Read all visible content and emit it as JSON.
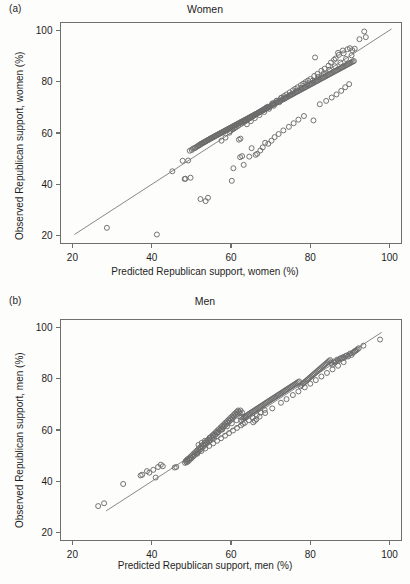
{
  "figure": {
    "background_color": "#fdfdfc",
    "point_stroke_color": "#6b6b6b",
    "line_color": "#7a7a7a",
    "axis_color": "#6f6f6f"
  },
  "panels": [
    {
      "tag": "(a)",
      "title": "Women",
      "xlabel": "Predicted Republican support, women (%)",
      "ylabel": "Observed Republican support, women (%)"
    },
    {
      "tag": "(b)",
      "title": "Men",
      "xlabel": "Predicted Republican support, men (%)",
      "ylabel": "Observed Republican support, men (%)"
    }
  ],
  "chart_data": [
    {
      "type": "scatter",
      "panel": "(a)",
      "title": "Women",
      "xlabel": "Predicted Republican support, women (%)",
      "ylabel": "Observed Republican support, women (%)",
      "xlim": [
        17,
        103
      ],
      "ylim": [
        17,
        103
      ],
      "xticks": [
        20,
        40,
        60,
        80,
        100
      ],
      "yticks": [
        20,
        40,
        60,
        80,
        100
      ],
      "grid": false,
      "legend": "none",
      "reference_line": {
        "label": "y = x identity line",
        "x_start": 20.5,
        "y_start": 20.5,
        "x_end": 100.5,
        "y_end": 100.5
      },
      "marker": {
        "shape": "open-circle",
        "radius_px": 2.5
      },
      "x": [
        28.7,
        41.3,
        45.2,
        47.8,
        48.3,
        49.2,
        49.6,
        50.1,
        50.4,
        50.8,
        51.0,
        51.3,
        51.6,
        51.9,
        52.0,
        52.2,
        52.4,
        52.6,
        52.8,
        53.0,
        53.2,
        53.4,
        53.6,
        53.8,
        54.0,
        54.2,
        54.4,
        54.6,
        54.8,
        55.0,
        55.2,
        55.4,
        55.6,
        55.8,
        56.0,
        56.2,
        56.4,
        56.6,
        56.8,
        57.0,
        57.2,
        57.4,
        57.6,
        57.8,
        58.0,
        58.2,
        58.4,
        58.6,
        58.8,
        59.0,
        59.2,
        59.4,
        59.6,
        59.8,
        60.0,
        60.2,
        60.4,
        60.6,
        60.8,
        61.0,
        61.2,
        61.4,
        61.6,
        61.8,
        62.0,
        62.2,
        62.4,
        62.6,
        62.8,
        63.0,
        63.2,
        63.4,
        63.6,
        63.8,
        64.0,
        64.2,
        64.4,
        64.6,
        64.8,
        65.0,
        65.2,
        65.4,
        65.6,
        65.8,
        66.0,
        66.2,
        66.4,
        66.6,
        66.8,
        67.0,
        67.2,
        67.4,
        67.6,
        67.8,
        68.0,
        68.2,
        68.4,
        68.6,
        68.8,
        69.0,
        69.2,
        69.4,
        69.6,
        69.8,
        70.0,
        70.3,
        70.6,
        70.9,
        71.2,
        71.5,
        71.8,
        72.1,
        72.4,
        72.7,
        73.0,
        73.3,
        73.6,
        73.9,
        74.2,
        74.5,
        74.8,
        75.1,
        75.4,
        75.7,
        76.0,
        76.3,
        76.6,
        76.9,
        77.2,
        77.5,
        77.8,
        78.1,
        78.4,
        78.7,
        79.0,
        79.3,
        79.6,
        79.9,
        80.2,
        80.5,
        80.8,
        81.1,
        81.4,
        81.7,
        82.0,
        82.3,
        82.6,
        82.9,
        83.2,
        83.5,
        83.8,
        84.1,
        84.4,
        84.7,
        85.0,
        85.3,
        85.6,
        85.9,
        86.2,
        86.5,
        86.8,
        87.1,
        87.4,
        87.7,
        88.0,
        88.3,
        88.6,
        88.9,
        89.2,
        89.5,
        89.8,
        90.1,
        90.4,
        90.7,
        91.0,
        92.4,
        93.6,
        94.0,
        52.3,
        53.6,
        54.2,
        48.5,
        49.8,
        60.2,
        60.6,
        62.3,
        62.8,
        63.2,
        64.6,
        65.2,
        66.2,
        66.6,
        67.4,
        68.0,
        68.6,
        69.4,
        70.2,
        71.0,
        72.0,
        73.2,
        74.6,
        75.8,
        77.0,
        78.4,
        80.8,
        81.2,
        82.4,
        84.0,
        85.4,
        86.6,
        87.8,
        88.8,
        89.8,
        62.0,
        62.4,
        57.6,
        58.6,
        59.6,
        64.0,
        65.0,
        66.0,
        67.2,
        68.4,
        69.6,
        70.8,
        72.2,
        73.6,
        75.0,
        76.4,
        77.8,
        79.2,
        80.6,
        82.0,
        83.4,
        84.8,
        86.2,
        87.6,
        89.0,
        90.4,
        86.0,
        86.4,
        87.0,
        87.2,
        88.2,
        88.4,
        89.4,
        90.0,
        90.6,
        91.2,
        85.2,
        84.6,
        83.6,
        82.8,
        81.8,
        81.0,
        80.0,
        79.4,
        78.8,
        78.2,
        77.6,
        76.8,
        76.2,
        75.6,
        74.8,
        74.0,
        73.4,
        72.8,
        72.6,
        71.6,
        71.4,
        70.6,
        70.4,
        69.2,
        68.8,
        68.2,
        67.6,
        67.0,
        66.4,
        65.8,
        65.4,
        64.8,
        64.4,
        63.8,
        63.4,
        62.6,
        61.8,
        61.2,
        60.8,
        60.4,
        59.8
      ],
      "y": [
        23.1,
        20.5,
        45.1,
        49.2,
        42.1,
        49.3,
        53.1,
        53.4,
        53.9,
        54.1,
        54.3,
        54.6,
        54.9,
        55.1,
        55.3,
        55.5,
        55.7,
        55.9,
        56.0,
        56.2,
        56.4,
        56.6,
        56.7,
        56.9,
        57.1,
        57.3,
        57.4,
        57.6,
        57.8,
        58.0,
        58.1,
        58.3,
        58.5,
        58.6,
        58.8,
        59.0,
        59.1,
        59.3,
        59.5,
        59.6,
        59.8,
        60.0,
        60.1,
        60.3,
        60.5,
        60.6,
        60.8,
        61.0,
        61.1,
        61.3,
        61.5,
        61.6,
        61.8,
        62.0,
        62.1,
        62.3,
        62.5,
        62.6,
        62.8,
        63.0,
        63.1,
        63.3,
        63.5,
        63.6,
        63.8,
        64.0,
        64.1,
        64.3,
        64.5,
        64.6,
        64.8,
        65.0,
        65.1,
        65.3,
        65.5,
        65.6,
        65.8,
        66.0,
        66.1,
        66.3,
        66.5,
        66.6,
        66.8,
        67.0,
        67.1,
        67.3,
        67.5,
        67.6,
        67.8,
        68.0,
        68.1,
        68.3,
        68.5,
        68.6,
        68.8,
        69.0,
        69.1,
        69.3,
        69.5,
        69.6,
        69.8,
        70.0,
        70.1,
        70.3,
        70.5,
        70.8,
        71.0,
        71.3,
        71.5,
        71.8,
        72.0,
        72.3,
        72.5,
        72.8,
        73.0,
        73.3,
        73.5,
        73.8,
        74.0,
        74.3,
        74.5,
        74.8,
        75.0,
        75.3,
        75.5,
        75.8,
        76.0,
        76.3,
        76.5,
        76.8,
        77.0,
        77.3,
        77.5,
        77.8,
        78.0,
        78.3,
        78.5,
        78.8,
        79.0,
        79.3,
        79.5,
        79.8,
        80.0,
        80.3,
        80.5,
        80.8,
        81.0,
        81.3,
        81.5,
        81.8,
        82.0,
        82.3,
        82.5,
        82.8,
        83.0,
        83.3,
        83.5,
        83.8,
        84.0,
        84.3,
        84.5,
        84.8,
        85.0,
        85.3,
        85.5,
        85.8,
        86.0,
        86.3,
        86.5,
        86.8,
        87.0,
        87.3,
        87.5,
        87.8,
        88.0,
        96.5,
        99.5,
        97.3,
        34.3,
        33.5,
        34.8,
        42.2,
        42.6,
        41.4,
        46.3,
        50.6,
        51.0,
        47.6,
        50.8,
        54.1,
        51.5,
        51.9,
        53.2,
        54.4,
        56.2,
        55.8,
        57.0,
        58.4,
        59.6,
        61.0,
        62.4,
        63.8,
        65.2,
        66.6,
        64.9,
        89.4,
        71.2,
        72.5,
        73.8,
        75.0,
        76.4,
        77.8,
        79.0,
        57.4,
        57.8,
        57.0,
        58.2,
        60.1,
        63.4,
        64.6,
        65.8,
        67.0,
        68.2,
        69.4,
        70.6,
        72.0,
        73.4,
        74.8,
        76.2,
        77.6,
        79.0,
        80.4,
        81.8,
        83.2,
        84.6,
        86.0,
        87.4,
        88.8,
        90.2,
        88.5,
        89.0,
        91.2,
        90.4,
        92.1,
        91.0,
        92.6,
        93.0,
        92.2,
        92.8,
        87.4,
        86.2,
        85.0,
        84.2,
        83.0,
        82.2,
        81.0,
        80.4,
        79.8,
        79.2,
        78.6,
        77.8,
        77.2,
        76.6,
        75.8,
        75.0,
        74.4,
        73.8,
        73.6,
        72.6,
        72.4,
        71.6,
        71.4,
        70.2,
        69.8,
        69.2,
        68.6,
        68.0,
        67.4,
        66.8,
        66.4,
        65.8,
        65.4,
        64.8,
        64.4,
        63.6,
        62.8,
        62.2,
        61.8,
        61.4,
        60.8
      ]
    },
    {
      "type": "scatter",
      "panel": "(b)",
      "title": "Men",
      "xlabel": "Predicted Republican support, men (%)",
      "ylabel": "Observed Republican support, men (%)",
      "xlim": [
        17,
        103
      ],
      "ylim": [
        17,
        103
      ],
      "xticks": [
        20,
        40,
        60,
        80,
        100
      ],
      "yticks": [
        20,
        40,
        60,
        80,
        100
      ],
      "grid": false,
      "legend": "none",
      "reference_line": {
        "label": "y = x identity line",
        "x_start": 28.5,
        "y_start": 28.5,
        "x_end": 98.0,
        "y_end": 98.0
      },
      "marker": {
        "shape": "open-circle",
        "radius_px": 2.5
      },
      "x": [
        26.5,
        28.0,
        32.8,
        37.2,
        37.6,
        38.8,
        39.4,
        40.4,
        41.0,
        41.6,
        42.3,
        42.8,
        45.8,
        46.2,
        48.4,
        48.6,
        48.8,
        49.0,
        49.2,
        49.4,
        49.6,
        49.8,
        50.0,
        50.2,
        50.4,
        50.6,
        50.8,
        51.0,
        51.2,
        51.4,
        51.6,
        51.8,
        52.0,
        52.2,
        52.4,
        52.6,
        52.8,
        53.0,
        53.2,
        53.4,
        53.6,
        53.8,
        54.0,
        54.2,
        54.4,
        54.6,
        54.8,
        55.0,
        55.2,
        55.4,
        55.6,
        55.8,
        56.0,
        56.2,
        56.4,
        56.6,
        56.8,
        57.0,
        57.2,
        57.4,
        57.6,
        57.8,
        58.0,
        58.2,
        58.4,
        58.6,
        58.8,
        59.0,
        59.2,
        59.4,
        59.6,
        59.8,
        60.0,
        60.2,
        60.4,
        60.6,
        60.8,
        61.0,
        61.2,
        61.4,
        61.6,
        61.8,
        62.0,
        62.2,
        62.4,
        62.6,
        62.8,
        63.0,
        63.2,
        63.4,
        63.6,
        63.8,
        64.0,
        64.3,
        64.6,
        64.9,
        65.2,
        65.5,
        65.8,
        66.1,
        66.4,
        66.7,
        67.0,
        67.3,
        67.6,
        67.9,
        68.2,
        68.5,
        68.8,
        69.1,
        69.4,
        69.7,
        70.0,
        70.3,
        70.6,
        70.9,
        71.2,
        71.5,
        71.8,
        72.1,
        72.4,
        72.7,
        73.0,
        73.3,
        73.6,
        73.9,
        74.2,
        74.5,
        74.8,
        75.1,
        75.4,
        75.7,
        76.0,
        76.3,
        76.6,
        76.9,
        77.2,
        77.5,
        77.8,
        78.1,
        78.4,
        78.7,
        79.0,
        79.3,
        79.6,
        79.9,
        80.2,
        80.5,
        80.8,
        81.1,
        81.4,
        81.7,
        82.0,
        82.3,
        82.6,
        82.9,
        83.2,
        83.5,
        83.8,
        84.1,
        84.4,
        84.7,
        85.0,
        85.3,
        85.6,
        85.9,
        86.2,
        86.5,
        86.8,
        87.1,
        87.4,
        87.7,
        88.0,
        88.3,
        88.6,
        88.9,
        89.2,
        89.5,
        89.8,
        90.1,
        90.4,
        90.7,
        91.0,
        91.3,
        91.6,
        91.9,
        92.2,
        93.4,
        97.6,
        62.6,
        63.0,
        65.6,
        66.0,
        66.4,
        67.2,
        68.6,
        70.4,
        72.6,
        74.0,
        75.6,
        77.0,
        78.6,
        80.0,
        81.4,
        82.8,
        84.2,
        85.6,
        87.0,
        88.4,
        51.8,
        52.6,
        53.4,
        54.6,
        55.4,
        56.6,
        57.8,
        59.0,
        60.2,
        61.4,
        48.9,
        49.5,
        50.5,
        51.5,
        52.5,
        53.5,
        54.5,
        55.5,
        56.5,
        57.5,
        58.5,
        59.5,
        60.5,
        61.5,
        62.5,
        63.5,
        64.5,
        65.5,
        66.5,
        67.5,
        68.5
      ],
      "y": [
        30.4,
        31.5,
        39.0,
        42.3,
        42.6,
        44.0,
        43.4,
        44.5,
        41.5,
        45.6,
        46.5,
        45.9,
        45.4,
        45.6,
        47.2,
        48.0,
        47.4,
        48.6,
        47.8,
        49.0,
        48.4,
        49.6,
        49.0,
        50.2,
        49.6,
        50.8,
        50.2,
        51.4,
        50.8,
        52.0,
        51.4,
        52.6,
        52.0,
        53.2,
        52.6,
        53.8,
        53.2,
        54.4,
        53.8,
        55.0,
        54.4,
        55.6,
        55.0,
        56.2,
        55.6,
        56.8,
        56.2,
        57.4,
        56.8,
        58.0,
        57.4,
        58.6,
        58.0,
        59.2,
        58.6,
        59.8,
        59.2,
        60.4,
        59.8,
        61.0,
        60.4,
        61.6,
        61.0,
        62.2,
        61.6,
        62.8,
        62.2,
        63.4,
        62.8,
        64.0,
        63.4,
        64.6,
        64.0,
        65.2,
        64.6,
        65.8,
        65.2,
        66.4,
        65.8,
        67.0,
        66.4,
        67.6,
        67.0,
        66.5,
        67.6,
        63.8,
        66.8,
        64.4,
        65.0,
        64.8,
        65.4,
        65.0,
        65.6,
        66.0,
        66.3,
        66.6,
        66.9,
        67.2,
        67.5,
        67.8,
        68.1,
        68.4,
        68.7,
        69.0,
        69.3,
        69.6,
        69.9,
        70.2,
        70.5,
        70.8,
        71.1,
        71.4,
        71.7,
        72.0,
        72.3,
        72.6,
        72.9,
        73.2,
        73.5,
        73.8,
        74.1,
        74.4,
        74.7,
        75.0,
        75.3,
        75.6,
        75.9,
        76.2,
        76.5,
        76.8,
        77.1,
        77.4,
        77.7,
        78.0,
        78.3,
        78.6,
        78.9,
        77.0,
        77.5,
        78.0,
        78.4,
        78.8,
        79.2,
        79.6,
        80.0,
        80.4,
        80.8,
        81.2,
        81.6,
        82.0,
        82.4,
        82.8,
        83.2,
        83.6,
        84.0,
        84.4,
        84.8,
        85.2,
        85.6,
        86.0,
        86.4,
        86.8,
        87.2,
        86.0,
        85.4,
        86.6,
        86.2,
        86.8,
        87.4,
        87.0,
        87.6,
        88.0,
        87.8,
        88.4,
        88.2,
        88.8,
        89.0,
        88.6,
        89.4,
        89.8,
        89.2,
        90.0,
        90.4,
        90.8,
        91.0,
        91.4,
        91.8,
        92.8,
        95.2,
        65.0,
        62.4,
        63.0,
        63.6,
        64.2,
        65.2,
        66.6,
        68.4,
        70.6,
        72.0,
        73.6,
        75.0,
        76.6,
        78.0,
        79.4,
        80.8,
        82.2,
        83.6,
        85.0,
        86.4,
        54.2,
        55.0,
        55.8,
        57.0,
        57.8,
        59.0,
        60.2,
        61.4,
        62.6,
        63.8,
        48.2,
        48.8,
        49.8,
        50.8,
        51.8,
        52.8,
        53.8,
        54.8,
        55.8,
        56.8,
        57.8,
        58.8,
        59.8,
        60.8,
        61.8,
        62.8,
        63.8,
        64.8,
        65.8,
        66.8,
        67.8
      ]
    }
  ]
}
